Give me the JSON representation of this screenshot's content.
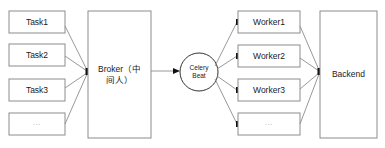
{
  "diagram": {
    "stroke_color": "#8c8c8c",
    "marker_color": "#111111",
    "background_color": "#ffffff",
    "producers": [
      {
        "label": "Task1",
        "x": 9,
        "y": 11,
        "w": 56,
        "h": 22
      },
      {
        "label": "Task2",
        "x": 9,
        "y": 44,
        "w": 56,
        "h": 22
      },
      {
        "label": "Task3",
        "x": 9,
        "y": 79,
        "w": 56,
        "h": 22
      },
      {
        "label": "...",
        "x": 9,
        "y": 113,
        "w": 56,
        "h": 22
      }
    ],
    "broker": {
      "label": "Broker（中\n间人）",
      "x": 88,
      "y": 11,
      "w": 63,
      "h": 127
    },
    "beat": {
      "label": "Celery\nBeat",
      "cx": 199,
      "cy": 72,
      "r": 19
    },
    "workers": [
      {
        "label": "Worker1",
        "x": 238,
        "y": 11,
        "w": 62,
        "h": 22
      },
      {
        "label": "Worker2",
        "x": 238,
        "y": 45,
        "w": 62,
        "h": 22
      },
      {
        "label": "Worker3",
        "x": 238,
        "y": 79,
        "w": 62,
        "h": 22
      },
      {
        "label": "...",
        "x": 238,
        "y": 113,
        "w": 62,
        "h": 22
      }
    ],
    "backend": {
      "label": "Backend",
      "x": 320,
      "y": 11,
      "w": 57,
      "h": 127
    },
    "edges": [
      {
        "from": "Task1",
        "to": "Broker"
      },
      {
        "from": "Task2",
        "to": "Broker"
      },
      {
        "from": "Task3",
        "to": "Broker"
      },
      {
        "from": "TaskMore",
        "to": "Broker"
      },
      {
        "from": "Broker",
        "to": "CeleryBeat"
      },
      {
        "from": "CeleryBeat",
        "to": "Worker1"
      },
      {
        "from": "CeleryBeat",
        "to": "Worker2"
      },
      {
        "from": "CeleryBeat",
        "to": "Worker3"
      },
      {
        "from": "CeleryBeat",
        "to": "WorkerMore"
      },
      {
        "from": "Worker1",
        "to": "Backend"
      },
      {
        "from": "Worker2",
        "to": "Backend"
      },
      {
        "from": "Worker3",
        "to": "Backend"
      },
      {
        "from": "WorkerMore",
        "to": "Backend"
      }
    ]
  }
}
